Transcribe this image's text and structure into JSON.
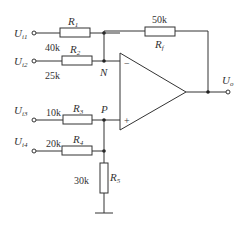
{
  "diagram": {
    "type": "op-amp summing circuit",
    "inputs": [
      {
        "name": "U",
        "sub": "i1"
      },
      {
        "name": "U",
        "sub": "i2"
      },
      {
        "name": "U",
        "sub": "i3"
      },
      {
        "name": "U",
        "sub": "i4"
      }
    ],
    "output": {
      "name": "U",
      "sub": "o"
    },
    "resistors": [
      {
        "name": "R",
        "sub": "1",
        "value": "40k"
      },
      {
        "name": "R",
        "sub": "2",
        "value": "25k"
      },
      {
        "name": "R",
        "sub": "3",
        "value": "10k"
      },
      {
        "name": "R",
        "sub": "4",
        "value": "20k"
      },
      {
        "name": "R",
        "sub": "5",
        "value": "30k"
      },
      {
        "name": "R",
        "sub": "f",
        "value": "50k"
      }
    ],
    "nodes": {
      "inverting": "N",
      "noninverting": "P"
    },
    "opamp": {
      "minus": "−",
      "plus": "+"
    }
  }
}
